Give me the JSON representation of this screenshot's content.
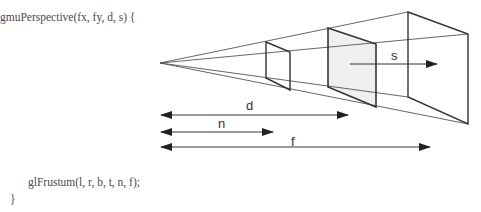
{
  "code": {
    "signature": "gmuPerspective(fx, fy, d, s) {",
    "call": "glFrustum(l, r, b, t, n, f);",
    "closing": "}"
  },
  "diagram": {
    "labels": {
      "s": "s",
      "d": "d",
      "n": "n",
      "f": "f"
    },
    "colors": {
      "line": "#333333",
      "plane_fill": "#efefef"
    },
    "apex": [
      160,
      63
    ],
    "near_plane": {
      "left_x": 266,
      "left_top": 42,
      "left_bottom": 78,
      "right_x": 290,
      "right_top": 52,
      "right_bottom": 90
    },
    "mid_plane": {
      "left_x": 328,
      "left_top": 28,
      "left_bottom": 87,
      "right_x": 376,
      "right_top": 44,
      "right_bottom": 107
    },
    "far_plane": {
      "left_x": 408,
      "left_top": 12,
      "left_bottom": 97,
      "right_x": 468,
      "right_top": 34,
      "right_bottom": 124
    },
    "dimension_arrows": [
      {
        "name": "d",
        "y": 115,
        "x1": 161,
        "x2": 348
      },
      {
        "name": "n",
        "y": 132,
        "x1": 161,
        "x2": 273
      },
      {
        "name": "f",
        "y": 147,
        "x1": 161,
        "x2": 430
      }
    ]
  }
}
